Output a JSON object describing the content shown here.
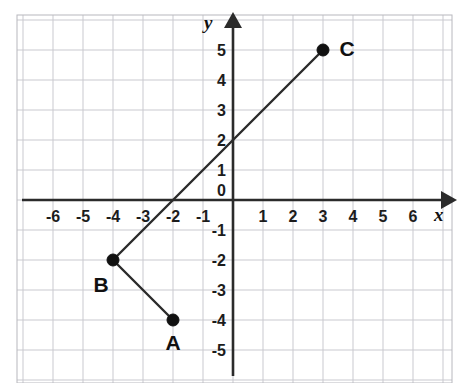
{
  "chart_data": {
    "type": "scatter",
    "title": "",
    "xlabel": "x",
    "ylabel": "y",
    "xlim": [
      -7.2,
      7.3
    ],
    "ylim": [
      -6.2,
      5.9
    ],
    "grid": true,
    "grid_step": 1,
    "legend": "none",
    "x_ticks": [
      "-6",
      "-5",
      "-4",
      "-3",
      "-2",
      "-1",
      "1",
      "2",
      "3",
      "4",
      "5",
      "6"
    ],
    "x_tick_values": [
      -6,
      -5,
      -4,
      -3,
      -2,
      -1,
      1,
      2,
      3,
      4,
      5,
      6
    ],
    "y_ticks": [
      "5",
      "4",
      "3",
      "2",
      "1",
      "-1",
      "-2",
      "-3",
      "-4",
      "-5"
    ],
    "y_tick_values": [
      5,
      4,
      3,
      2,
      1,
      -1,
      -2,
      -3,
      -4,
      -5
    ],
    "origin_label": "0",
    "points": [
      {
        "label": "A",
        "x": -2,
        "y": -4,
        "label_dx": 0,
        "label_dy": 30
      },
      {
        "label": "B",
        "x": -4,
        "y": -2,
        "label_dx": -12,
        "label_dy": 32
      },
      {
        "label": "C",
        "x": 3,
        "y": 5,
        "label_dx": 24,
        "label_dy": 6
      }
    ],
    "segments": [
      {
        "name": "segment-b-c",
        "from": "B",
        "to": "C",
        "x1": -4,
        "y1": -2,
        "x2": 3,
        "y2": 5
      },
      {
        "name": "segment-b-a",
        "from": "B",
        "to": "A",
        "x1": -4,
        "y1": -2,
        "x2": -2,
        "y2": -4
      }
    ],
    "annotations": [
      {
        "name": "y-intercept",
        "x": 0,
        "y": 2
      },
      {
        "name": "x-intercept",
        "x": -2,
        "y": 0
      }
    ],
    "colors": {
      "grid": "#c9c9cf",
      "axis": "#2b2b2b",
      "segment": "#2b2b2b",
      "point": "#111111",
      "text": "#1c1c1c",
      "background": "#ffffff"
    }
  },
  "figure": {
    "x_axis_name": "x",
    "y_axis_name": "y"
  }
}
